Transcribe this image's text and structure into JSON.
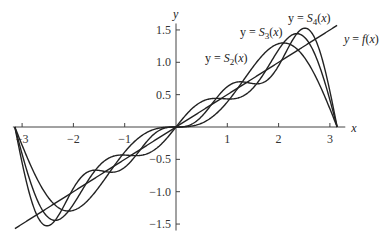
{
  "chart_data": {
    "type": "line",
    "title": "",
    "xlabel": "x",
    "ylabel": "y",
    "xlim": [
      -3.14159,
      3.14159
    ],
    "ylim": [
      -1.6,
      1.6
    ],
    "grid": false,
    "x_ticks": [
      "-3",
      "-2",
      "-1",
      "1",
      "2",
      "3"
    ],
    "y_ticks": [
      "1.5",
      "1.0",
      "0.5",
      "-0.5",
      "-1.0",
      "-1.5"
    ],
    "series": [
      {
        "name": "y = f(x)",
        "function": "x/2"
      },
      {
        "name": "y = S2(x)",
        "function": "sin(x) - sin(2x)/2"
      },
      {
        "name": "y = S3(x)",
        "function": "sin(x) - sin(2x)/2 + sin(3x)/3"
      },
      {
        "name": "y = S4(x)",
        "function": "sin(x) - sin(2x)/2 + sin(3x)/3 - sin(4x)/4"
      }
    ],
    "annotations": [
      {
        "text_parts": [
          "y = S",
          "2",
          "(x)"
        ],
        "x": 205,
        "y": 62
      },
      {
        "text_parts": [
          "y = S",
          "3",
          "(x)"
        ],
        "x": 240,
        "y": 36
      },
      {
        "text_parts": [
          "y = S",
          "4",
          "(x)"
        ],
        "x": 288,
        "y": 22
      },
      {
        "text_parts": [
          "y = ",
          "f",
          "(x)"
        ],
        "x": 344,
        "y": 43
      }
    ]
  }
}
